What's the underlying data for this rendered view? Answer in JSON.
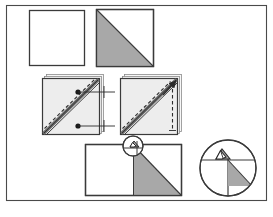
{
  "figure": {
    "caption": "",
    "frame": {
      "x": 6,
      "y": 5,
      "width": 261,
      "height": 196,
      "stroke": "#4a4a4a",
      "stroke_width": 1.2,
      "fill": "#ffffff"
    },
    "colors": {
      "background": "#ffffff",
      "outline": "#3a3a3a",
      "fabric_light": "#ededed",
      "fabric_gray": "#a8a8a8",
      "seam_dark": "#6b6b6b",
      "stitch_line": "#2b2b2b",
      "shadow": "#f7f7f7",
      "caption": "#b9b9b9"
    },
    "steps": [
      {
        "id": "step-1-plain-square",
        "label": "plain white fabric square",
        "shape": "square",
        "x": 29,
        "y": 10,
        "width": 56,
        "height": 56,
        "fill": "#ffffff",
        "stroke": "#3a3a3a"
      },
      {
        "id": "step-2-half-square-triangle",
        "label": "square with gray triangle on lower-left half",
        "shape": "square-with-diagonal-fill",
        "x": 96,
        "y": 9,
        "width": 58,
        "height": 58,
        "fill": "#ffffff",
        "triangle_fill": "#a8a8a8",
        "diagonal": "top-left-to-bottom-right",
        "filled_half": "lower-left",
        "stroke": "#3a3a3a"
      },
      {
        "id": "step-3-left-stitched-pair",
        "label": "stacked squares with stitching line and seam, marked with two dots",
        "shape": "layered-square",
        "x": 42,
        "y": 74,
        "width": 60,
        "height": 60,
        "fill": "#ededed",
        "stroke": "#3a3a3a",
        "seam_color": "#6b6b6b",
        "dashed_line": true,
        "dot_count": 2,
        "leader_lines": 2
      },
      {
        "id": "step-4-right-stitched-pair",
        "label": "stacked squares with stitching line, seam and upward arrow on right edge",
        "shape": "layered-square",
        "x": 120,
        "y": 74,
        "width": 60,
        "height": 60,
        "fill": "#ededed",
        "stroke": "#3a3a3a",
        "seam_color": "#6b6b6b",
        "dashed_line": true,
        "arrow": "up-right",
        "vertical_dashed_edge": true
      },
      {
        "id": "step-5-opened-unit",
        "label": "opened rectangle unit with gray triangle on right half",
        "shape": "rectangle-with-triangle",
        "x": 85,
        "y": 144,
        "width": 97,
        "height": 52,
        "fill": "#ffffff",
        "triangle_fill": "#a8a8a8",
        "stroke": "#3a3a3a",
        "apex_x": 133
      },
      {
        "id": "callout-circle-small",
        "label": "detail callout circle on opened unit corner",
        "shape": "circle",
        "cx": 133,
        "cy": 146,
        "r": 10,
        "stroke": "#3a3a3a",
        "fill": "none"
      },
      {
        "id": "callout-circle-magnified",
        "label": "magnified detail of seam corner with folded tab",
        "shape": "circle",
        "cx": 228,
        "cy": 168,
        "r": 28,
        "stroke": "#3a3a3a",
        "fill": "#ffffff",
        "triangle_fill": "#a8a8a8"
      }
    ]
  }
}
